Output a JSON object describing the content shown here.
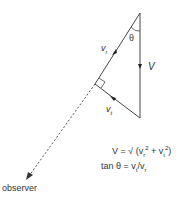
{
  "diagram": {
    "labels": {
      "theta": "θ",
      "V": "V",
      "vr_main": "v",
      "vr_sub": "r",
      "vt_main": "v",
      "vt_sub": "t",
      "observer": "observer"
    },
    "equations": {
      "eq1_lhs": "V = √ (v",
      "eq1_r": "r",
      "eq1_mid": " + v",
      "eq1_t": "t",
      "eq1_sq": "2",
      "eq1_close": ")",
      "eq2_lhs": "tan θ = v",
      "eq2_t": "t",
      "eq2_mid": "/v",
      "eq2_r": "r"
    },
    "colors": {
      "line": "#444444",
      "text": "#333333"
    }
  }
}
